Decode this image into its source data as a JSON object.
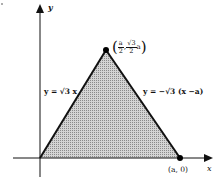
{
  "diagram": {
    "axes": {
      "x_label": "x",
      "y_label": "y"
    },
    "region": "shaded equilateral triangle",
    "vertices": {
      "origin": "",
      "apex": {
        "open": "(",
        "x_num": "a",
        "x_den": "2",
        "sep": ",",
        "y_num": "√3",
        "y_den": "2",
        "y_var": "a",
        "close": ")"
      },
      "right": "(a, 0)"
    },
    "lines": {
      "left": "y = √3 x",
      "right": "y = −√3 (x −a)"
    },
    "colors": {
      "stroke": "#111111",
      "fill": "#bdbdbd",
      "point": "#000000"
    }
  }
}
